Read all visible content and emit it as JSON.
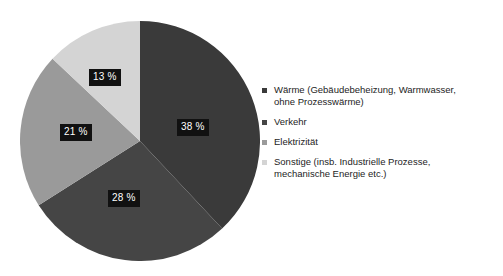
{
  "chart_data": {
    "type": "pie",
    "title": "",
    "subtitle": "",
    "xlabel": "",
    "ylabel": "",
    "grid": false,
    "legend_position": "right",
    "start_angle_deg": 0,
    "direction": "clockwise",
    "categories": [
      "Wärme (Gebäudebeheizung, Warmwasser, ohne Prozesswärme)",
      "Verkehr",
      "Elektrizität",
      "Sonstige (insb. Industrielle Prozesse, mechanische Energie etc.)"
    ],
    "values": [
      38,
      28,
      21,
      13
    ],
    "value_labels": [
      "38 %",
      "28 %",
      "21 %",
      "13 %"
    ],
    "colors": [
      "#3a3a3a",
      "#454545",
      "#9a9a9a",
      "#d4d4d4"
    ],
    "units": "%"
  },
  "pie": {
    "slices": [
      {
        "label": "38 %",
        "value": 38,
        "color": "#3a3a3a"
      },
      {
        "label": "28 %",
        "value": 28,
        "color": "#454545"
      },
      {
        "label": "21 %",
        "value": 21,
        "color": "#9a9a9a"
      },
      {
        "label": "13 %",
        "value": 13,
        "color": "#d4d4d4"
      }
    ]
  },
  "legend": {
    "items": [
      {
        "color": "#3a3a3a",
        "line1": "Wärme (Gebäudebeheizung, Warmwasser,",
        "line2": "ohne Prozesswärme)"
      },
      {
        "color": "#454545",
        "line1": "Verkehr",
        "line2": ""
      },
      {
        "color": "#9a9a9a",
        "line1": "Elektrizität",
        "line2": ""
      },
      {
        "color": "#d4d4d4",
        "line1": "Sonstige (insb. Industrielle Prozesse,",
        "line2": "mechanische Energie etc.)"
      }
    ]
  }
}
